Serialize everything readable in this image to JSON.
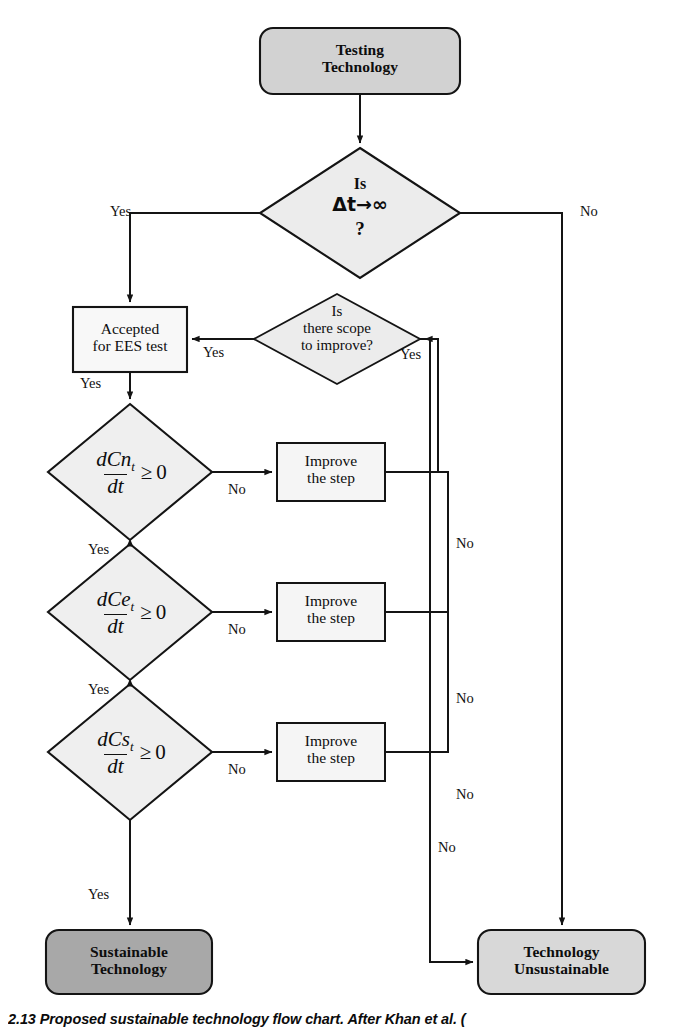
{
  "figure": {
    "type": "flowchart",
    "title": "Proposed sustainable technology flow chart",
    "caption": "2.13   Proposed sustainable technology flow chart. After Khan et al. ("
  },
  "colors": {
    "stroke": "#141414",
    "terminal_start_fill": "#d2d2d2",
    "terminal_sustainable_fill": "#a8a8a8",
    "terminal_unsustainable_fill": "#d8d8d8",
    "decision_fill": "#ececec",
    "process_fill": "#f2f2f2",
    "page_background": "#ffffff"
  },
  "nodes": {
    "start": {
      "shape": "rounded-terminal",
      "line1": "Testing",
      "line2": "Technology"
    },
    "decision_dt": {
      "shape": "diamond",
      "line1": "Is",
      "line2": "Δt→∞",
      "line3": "?"
    },
    "accepted": {
      "shape": "rectangle",
      "line1": "Accepted",
      "line2": "for EES test"
    },
    "scope": {
      "shape": "diamond",
      "line1": "Is",
      "line2": "there scope",
      "line3": "to improve?"
    },
    "decision_cn": {
      "shape": "diamond",
      "numerator": "dCn",
      "num_sub": "t",
      "denominator": "dt",
      "relation": "≥",
      "rhs": "0"
    },
    "decision_ce": {
      "shape": "diamond",
      "numerator": "dCe",
      "num_sub": "t",
      "denominator": "dt",
      "relation": "≥",
      "rhs": "0"
    },
    "decision_cs": {
      "shape": "diamond",
      "numerator": "dCs",
      "num_sub": "t",
      "denominator": "dt",
      "relation": "≥",
      "rhs": "0"
    },
    "improve_1": {
      "shape": "rectangle",
      "line1": "Improve",
      "line2": "the step"
    },
    "improve_2": {
      "shape": "rectangle",
      "line1": "Improve",
      "line2": "the step"
    },
    "improve_3": {
      "shape": "rectangle",
      "line1": "Improve",
      "line2": "the step"
    },
    "sustainable": {
      "shape": "rounded-terminal",
      "line1": "Sustainable",
      "line2": "Technology"
    },
    "unsustainable": {
      "shape": "rounded-terminal",
      "line1": "Technology",
      "line2": "Unsustainable"
    }
  },
  "edge_labels": {
    "dt_yes": "Yes",
    "dt_no": "No",
    "scope_yes_left": "Yes",
    "scope_yes_right": "Yes",
    "scope_no": "No",
    "accepted_yes": "Yes",
    "cn_no": "No",
    "cn_yes": "Yes",
    "ce_no": "No",
    "ce_yes": "Yes",
    "cs_no": "No",
    "cs_yes": "Yes",
    "improve1_no": "No",
    "improve2_no": "No",
    "improve3_no": "No"
  }
}
